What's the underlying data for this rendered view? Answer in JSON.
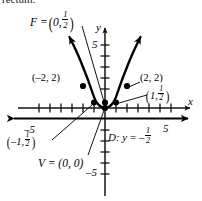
{
  "figure": {
    "kind": "parabola-graph",
    "clipped_body_text": "rectum.",
    "axes": {
      "x_axis_letter": "x",
      "y_axis_letter": "y",
      "x_tick_label_negative": "–5",
      "x_tick_label_positive": "5",
      "y_tick_label_positive": "5",
      "y_tick_label_negative": "–5",
      "tick_spacing_px": 11,
      "x_range": [
        -6,
        6
      ],
      "y_range": [
        -6,
        6
      ]
    },
    "focus": {
      "name": "focus-label",
      "prefix": "F =",
      "open_paren": "(",
      "x_value": "0,",
      "frac_num": "1",
      "frac_den": "2",
      "close_paren": ")",
      "point": [
        0,
        0.5
      ]
    },
    "vertex": {
      "name": "vertex-label",
      "text": "V = (0, 0)",
      "point": [
        0,
        0
      ]
    },
    "directrix": {
      "name": "directrix-label",
      "prefix": "D:",
      "equation_lhs": "y",
      "equals": "=",
      "minus": "–",
      "frac_num": "1",
      "frac_den": "2",
      "y_value": -0.5
    },
    "points": [
      {
        "name": "point-label-minus2-2",
        "text": "(–2, 2)",
        "coords": [
          -2,
          2
        ]
      },
      {
        "name": "point-label-2-2",
        "text": "(2, 2)",
        "coords": [
          2,
          2
        ]
      },
      {
        "name": "point-label-minus1-half",
        "open_paren": "(",
        "lead": "–1,",
        "frac_num": "1",
        "frac_den": "2",
        "close_paren": ")",
        "coords": [
          -1,
          0.5
        ]
      },
      {
        "name": "point-label-1-half",
        "open_paren": "(",
        "lead": "1,",
        "frac_num": "1",
        "frac_den": "2",
        "close_paren": ")",
        "coords": [
          1,
          0.5
        ]
      }
    ],
    "curve": {
      "equation": "y = x^2 / 2",
      "marked_points": [
        [
          -2,
          2
        ],
        [
          -1,
          0.5
        ],
        [
          0,
          0
        ],
        [
          1,
          0.5
        ],
        [
          2,
          2
        ]
      ]
    },
    "colors": {
      "ink": "#000000",
      "background": "#ffffff",
      "axis": "#1a1a1a",
      "curve": "#000000"
    }
  }
}
